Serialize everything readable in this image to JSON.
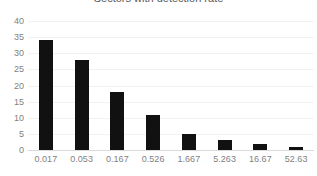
{
  "chart_data": {
    "type": "bar",
    "title": "Sectors with detection rate",
    "xlabel": "",
    "ylabel": "",
    "categories": [
      "0.017",
      "0.053",
      "0.167",
      "0.526",
      "1.667",
      "5.263",
      "16.67",
      "52.63"
    ],
    "values": [
      34,
      28,
      18,
      11,
      5,
      3,
      2,
      1
    ],
    "ylim": [
      0,
      40
    ],
    "yticks": [
      "0",
      "5",
      "10",
      "15",
      "20",
      "25",
      "30",
      "35",
      "40"
    ],
    "ytick_values": [
      0,
      5,
      10,
      15,
      20,
      25,
      30,
      35,
      40
    ],
    "grid": true,
    "legend": false,
    "bar_color": "#111111",
    "grid_color": "#f2f2f2",
    "axis_color": "#d9d9d9",
    "tick_label_color": "#7f7f7f",
    "title_color": "#595959"
  }
}
